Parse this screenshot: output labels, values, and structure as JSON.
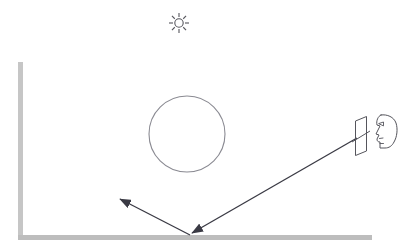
{
  "scene": {
    "title": "Light ray reflection optics diagram",
    "background_color": "#ffffff",
    "width": 410,
    "height": 250
  },
  "colors": {
    "wall": "#c6c6c6",
    "floor": "#bdbdbd",
    "ray": "#3a3a44",
    "outline": "#8a8a92",
    "sun": "#55555c",
    "mirror": "#55555c",
    "head": "#55555c"
  },
  "elements": {
    "sun": {
      "label": "sun",
      "center_x": 179,
      "center_y": 23,
      "core_radius": 4.2,
      "ray_count": 8,
      "ray_inner": 6,
      "ray_outer": 10
    },
    "wall": {
      "label": "vertical wall",
      "x": 18,
      "y": 62,
      "width": 5,
      "height": 178
    },
    "floor": {
      "label": "horizontal floor",
      "x": 18,
      "y": 235,
      "width": 354,
      "height": 5
    },
    "object_circle": {
      "label": "circular object",
      "center_x": 187,
      "center_y": 134,
      "radius": 38
    },
    "mirror_plane": {
      "label": "mirror plane",
      "points": "355,120 366,116 366,152 355,156",
      "slit_line": "351,141 370,130"
    },
    "observer_head": {
      "label": "observer head profile",
      "nose_x": 378,
      "eye_x": 383,
      "eye_y": 126
    },
    "incident_ray": {
      "label": "incident ray from mirror to floor",
      "x1": 357,
      "y1": 138,
      "x2": 190,
      "y2": 235,
      "arrow_at": "end"
    },
    "reflected_ray": {
      "label": "reflected ray from floor up-left",
      "x1": 190,
      "y1": 235,
      "x2": 120,
      "y2": 199,
      "arrow_at": "end"
    }
  },
  "chart_data": {
    "type": "diagram",
    "title": "Light ray reflection optics diagram",
    "annotations": [
      "sun light source at top",
      "circular object floating in room",
      "light ray travels from eye through mirror plane to floor",
      "ray reflects off floor toward upper left",
      "observer head profile at right viewing through mirror"
    ]
  }
}
